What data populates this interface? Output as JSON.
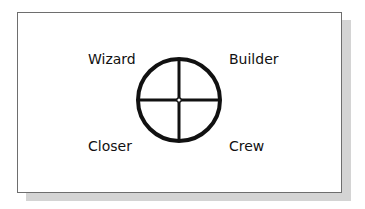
{
  "diagram": {
    "type": "quadrant-wheel",
    "quadrants": {
      "top_left": "Wizard",
      "top_right": "Builder",
      "bottom_left": "Closer",
      "bottom_right": "Crew"
    },
    "colors": {
      "stroke": "#111111",
      "background": "#ffffff",
      "frame_border": "#6e6e6e",
      "shadow": "#d4d4d4"
    }
  }
}
